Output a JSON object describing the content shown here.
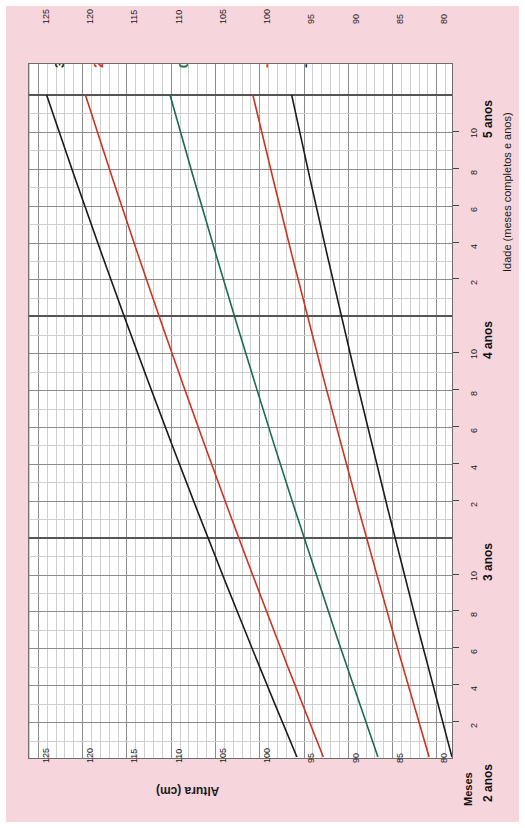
{
  "chart_data": {
    "type": "line",
    "title": "",
    "orientation": "rotated-90",
    "xlabel": "Idade (meses completos e anos)",
    "ylabel": "Altura (cm)",
    "months_label": "Meses",
    "ylim": [
      78,
      126
    ],
    "y_ticks": [
      125,
      120,
      115,
      110,
      105,
      100,
      95,
      90,
      85,
      80
    ],
    "y_minor_step": 1,
    "y_major_step": 5,
    "xlim_years": [
      2,
      5
    ],
    "x_year_ticks": [
      "2 anos",
      "3 anos",
      "4 anos",
      "5 anos"
    ],
    "x_month_ticks": [
      2,
      4,
      6,
      8,
      10
    ],
    "grid": true,
    "legend": "inline-end-labels",
    "series": [
      {
        "name": "3",
        "label": "3",
        "color": "#1a1a1a",
        "points": [
          {
            "age": 2,
            "cm": 95.6
          },
          {
            "age": 5,
            "cm": 124.0
          }
        ]
      },
      {
        "name": "2",
        "label": "2",
        "color": "#cc3322",
        "points": [
          {
            "age": 2,
            "cm": 92.6
          },
          {
            "age": 5,
            "cm": 119.6
          }
        ]
      },
      {
        "name": "0",
        "label": "0",
        "color": "#1a6b4a",
        "points": [
          {
            "age": 2,
            "cm": 86.4
          },
          {
            "age": 5,
            "cm": 110.0
          }
        ]
      },
      {
        "name": "-2",
        "label": "-2",
        "color": "#cc3322",
        "points": [
          {
            "age": 2,
            "cm": 80.6
          },
          {
            "age": 5,
            "cm": 100.6
          }
        ]
      },
      {
        "name": "-3",
        "label": "-3",
        "color": "#1a1a1a",
        "points": [
          {
            "age": 2,
            "cm": 78.0
          },
          {
            "age": 5,
            "cm": 96.2
          }
        ]
      }
    ]
  },
  "colors": {
    "page_background": "#f7d5dc",
    "plot_background": "#ffffff",
    "grid_minor": "#cfcfcf",
    "grid_major": "#8c8c8c",
    "year_line": "#555555",
    "black_curve": "#1a1a1a",
    "red_curve": "#cc3322",
    "green_curve": "#1a6b4a"
  }
}
